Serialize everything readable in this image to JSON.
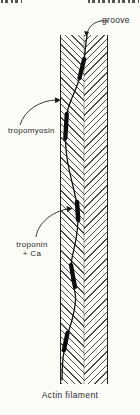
{
  "page": {
    "colors": {
      "paper": "#fbfbf8",
      "ink": "#242424",
      "hatch": "#4d4d4d"
    }
  },
  "diagram": {
    "caption": "Actin filament",
    "labels": {
      "groove": "groove",
      "tropomyosin": "tropomyosin",
      "troponin_line1": "troponin",
      "troponin_line2": "+ Ca"
    },
    "elements": {
      "filament_band": "herringbone-hatched vertical band",
      "strand": "tropomyosin strand winding in groove",
      "troponin_blob_count": 5
    }
  }
}
